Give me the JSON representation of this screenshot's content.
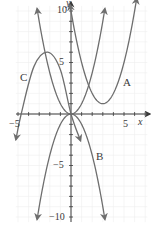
{
  "chart_data": {
    "type": "line",
    "title": "",
    "xlabel": "x",
    "ylabel": "y",
    "xlim": [
      -5.3,
      7.4
    ],
    "ylim": [
      -10.8,
      11
    ],
    "grid": true,
    "x_ticks": [
      -5,
      5
    ],
    "x_tick_labels": [
      "−5",
      "5"
    ],
    "y_ticks": [
      10,
      5,
      -5,
      -10
    ],
    "y_tick_labels": [
      "10",
      "5",
      "−5",
      "−10"
    ],
    "series": [
      {
        "name": "A",
        "equation_estimate": "y = (x - 3)^2 + 1",
        "points": [
          [
            -0.05,
            10.4
          ],
          [
            1,
            5
          ],
          [
            2,
            2
          ],
          [
            3,
            1
          ],
          [
            4,
            2
          ],
          [
            5,
            5
          ],
          [
            6.3,
            10.4
          ]
        ]
      },
      {
        "name": "B",
        "equation_estimate": "y = -x^2",
        "points": [
          [
            -3.2,
            -10.3
          ],
          [
            -2,
            -4
          ],
          [
            -1,
            -1
          ],
          [
            0,
            0
          ],
          [
            1,
            -1
          ],
          [
            2,
            -4
          ],
          [
            3.2,
            -10.3
          ]
        ]
      },
      {
        "name": "C",
        "points": [
          [
            -5.2,
            -2.5
          ],
          [
            -4.7,
            0
          ],
          [
            -3.5,
            4.6
          ],
          [
            -2.2,
            6
          ],
          [
            -1,
            4.3
          ],
          [
            0,
            0
          ],
          [
            0.9,
            -2.6
          ]
        ]
      },
      {
        "name": "",
        "equation_estimate": "y = x^2",
        "points": [
          [
            -3.3,
            10.4
          ],
          [
            -2,
            4
          ],
          [
            -1,
            1
          ],
          [
            0,
            0
          ],
          [
            1,
            1
          ],
          [
            2,
            4
          ],
          [
            3.2,
            10.4
          ]
        ]
      }
    ],
    "labels": {
      "A": "A",
      "B": "B",
      "C": "C",
      "x_axis": "x",
      "y_axis": "y"
    },
    "colors": {
      "curve": "#6e6e6e",
      "axis": "#3a3a3a",
      "grid": "#ededed"
    }
  }
}
